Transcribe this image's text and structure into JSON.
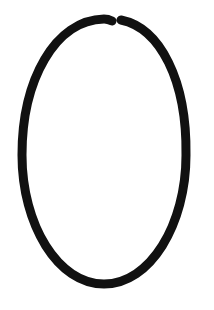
{
  "canvas": {
    "width": 214,
    "height": 310,
    "background": "#ffffff"
  },
  "shape": {
    "type": "open-ellipse-loop",
    "stroke_color": "#111111",
    "stroke_width": 9,
    "linecap": "round",
    "gap": {
      "left_end": [
        112,
        21
      ],
      "right_end": [
        121,
        20
      ]
    }
  }
}
